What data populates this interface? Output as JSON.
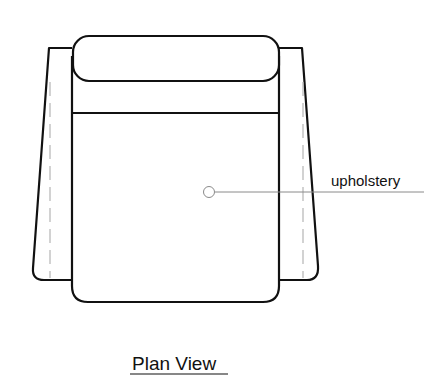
{
  "diagram": {
    "type": "furniture-plan-drawing",
    "title": "Plan View",
    "annotations": [
      {
        "label": "upholstery",
        "marker": "circle",
        "leader": "horizontal"
      }
    ],
    "parts": [
      "backrest-cushion",
      "back-frame",
      "seat-cushion",
      "left-arm",
      "right-arm"
    ],
    "colors": {
      "line": "#111111",
      "leader": "#8a8a8a",
      "dashed": "#b5b5b5",
      "background": "#ffffff"
    }
  }
}
